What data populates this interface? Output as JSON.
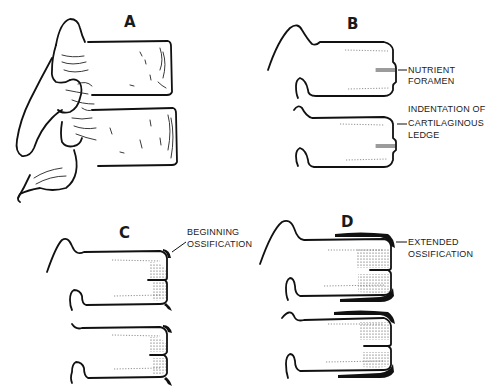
{
  "figure": {
    "panels": [
      {
        "id": "A",
        "label": "A",
        "description": "Lateral view of two lumbar vertebrae"
      },
      {
        "id": "B",
        "label": "B",
        "annotations": [
          "NUTRIENT",
          "FORAMEN",
          "INDENTATION OF",
          "CARTILAGINOUS",
          "LEDGE"
        ]
      },
      {
        "id": "C",
        "label": "C",
        "annotations": [
          "BEGINNING",
          "OSSIFICATION"
        ]
      },
      {
        "id": "D",
        "label": "D",
        "annotations": [
          "EXTENDED",
          "OSSIFICATION"
        ]
      }
    ]
  },
  "labels": {
    "A": "A",
    "B": "B",
    "C": "C",
    "D": "D"
  },
  "annotations": {
    "b_nutrient_1": "NUTRIENT",
    "b_nutrient_2": "FORAMEN",
    "b_indent_1": "INDENTATION OF",
    "b_indent_2": "CARTILAGINOUS",
    "b_indent_3": "LEDGE",
    "c_begin_1": "BEGINNING",
    "c_begin_2": "OSSIFICATION",
    "d_ext_1": "EXTENDED",
    "d_ext_2": "OSSIFICATION"
  }
}
